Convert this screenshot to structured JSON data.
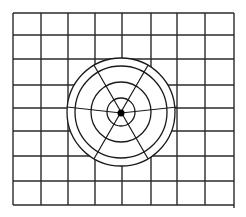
{
  "diagram": {
    "title": "",
    "colors": {
      "background": "#ffffff",
      "line": "#1a1a1a"
    },
    "grid": {
      "columns": 8,
      "rows": 8,
      "x_lines": [
        13,
        41,
        68,
        95,
        122,
        151,
        177,
        205,
        234
      ],
      "y_lines": [
        13,
        35,
        59,
        85,
        108,
        131,
        156,
        181,
        205
      ]
    },
    "polar": {
      "center": [
        121,
        112
      ],
      "ring_radii": [
        14,
        30,
        46,
        54
      ],
      "radial_angles_deg": [
        60,
        120,
        240,
        300
      ],
      "diameter": {
        "left": [
          67,
          107
        ],
        "center": [
          121,
          113
        ],
        "right": [
          177,
          107
        ]
      },
      "center_dot_radius": 3.5
    }
  }
}
